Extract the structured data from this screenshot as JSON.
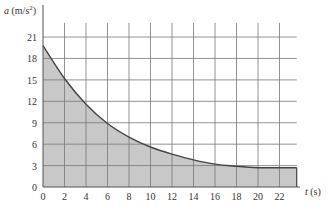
{
  "chart_data": {
    "type": "area",
    "title": "",
    "xlabel": "t (s)",
    "ylabel": "a (m/s²)",
    "xlim": [
      0,
      23.6
    ],
    "ylim": [
      0,
      24
    ],
    "grid": true,
    "x_ticks": [
      "0",
      "2",
      "4",
      "6",
      "8",
      "10",
      "12",
      "14",
      "16",
      "18",
      "20",
      "22"
    ],
    "y_ticks": [
      "0",
      "3",
      "6",
      "9",
      "12",
      "15",
      "18",
      "21"
    ],
    "series": [
      {
        "name": "a(t)",
        "x": [
          0,
          2,
          4,
          6,
          8,
          10,
          12,
          14,
          16,
          18,
          20,
          22,
          23.6
        ],
        "values": [
          19.8,
          15.2,
          11.6,
          8.9,
          7.0,
          5.6,
          4.6,
          3.8,
          3.2,
          2.9,
          2.7,
          2.7,
          2.7
        ]
      }
    ],
    "fill_color": "#c8c8c8",
    "line_color": "#444444"
  },
  "labels": {
    "ylabel_var": "a",
    "ylabel_unit": "(m/s",
    "ylabel_exp": "2",
    "ylabel_close": ")",
    "xlabel_var": "t",
    "xlabel_unit": "(s)"
  }
}
